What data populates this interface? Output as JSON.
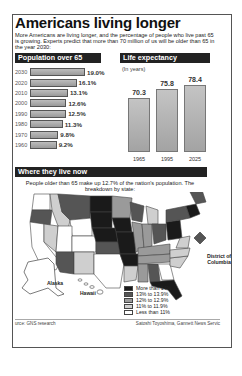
{
  "title": "Americans living longer",
  "intro": "More Americans are living longer, and the percentage of people who live past 65 is growing. Experts predict that more than 70 million of us will be older than 65 in the year 2030:",
  "sections": {
    "population": "Population over 65",
    "life": "Life expectancy",
    "where": "Where they live now"
  },
  "life_unit": "(In years)",
  "where_text": "People older than 65 make up 12.7% of the nation's population. The breakdown by state:",
  "map_labels": {
    "dc": "District of Columbia",
    "alaska": "Alaska",
    "hawaii": "Hawaii"
  },
  "legend": [
    {
      "label": "More than 14%",
      "color": "#1a1a1a"
    },
    {
      "label": "13% to 13.9%",
      "color": "#555555"
    },
    {
      "label": "12% to 12.9%",
      "color": "#9a9a9a"
    },
    {
      "label": "11% to 11.9%",
      "color": "#cfcfcf"
    },
    {
      "label": "Less than 11%",
      "color": "#ffffff"
    }
  ],
  "footer": {
    "source": "urce: GNS research",
    "credit": "Satoshi Toyoshima, Gannett News Servic"
  },
  "chart_data": [
    {
      "type": "bar",
      "orientation": "horizontal",
      "title": "Population over 65",
      "categories": [
        "2030",
        "2020",
        "2010",
        "2000",
        "1990",
        "1980",
        "1970",
        "1960"
      ],
      "values": [
        19.0,
        16.1,
        13.1,
        12.6,
        12.5,
        11.3,
        9.8,
        9.2
      ],
      "value_labels": [
        "19.0%",
        "16.1%",
        "13.1%",
        "12.6%",
        "12.5%",
        "11.3%",
        "9.8%",
        "9.2%"
      ],
      "ylabel": "% of population"
    },
    {
      "type": "bar",
      "title": "Life expectancy",
      "subtitle": "(In years)",
      "categories": [
        "1965",
        "1995",
        "2025"
      ],
      "values": [
        70.3,
        75.8,
        78.4
      ]
    },
    {
      "type": "heatmap",
      "title": "Where they live now",
      "description": "Choropleth map of US states by share of population over 65",
      "national_value": "12.7%",
      "legend": [
        "More than 14%",
        "13% to 13.9%",
        "12% to 12.9%",
        "11% to 11.9%",
        "Less than 11%"
      ]
    }
  ]
}
